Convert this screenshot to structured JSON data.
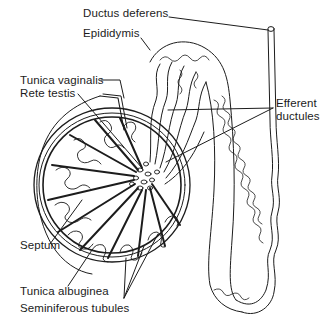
{
  "diagram": {
    "type": "anatomical-illustration",
    "line_color": "#1c1c1c",
    "background": "#ffffff",
    "labels": {
      "ductus_deferens": "Ductus deferens",
      "epididymis": "Epididymis",
      "tunica_vaginalis": "Tunica vaginalis",
      "rete_testis": "Rete testis",
      "efferent_ductules_line1": "Efferent",
      "efferent_ductules_line2": "ductules",
      "septum": "Septum",
      "tunica_albuginea": "Tunica albuginea",
      "seminiferous_tubules": "Seminiferous tubules"
    }
  }
}
